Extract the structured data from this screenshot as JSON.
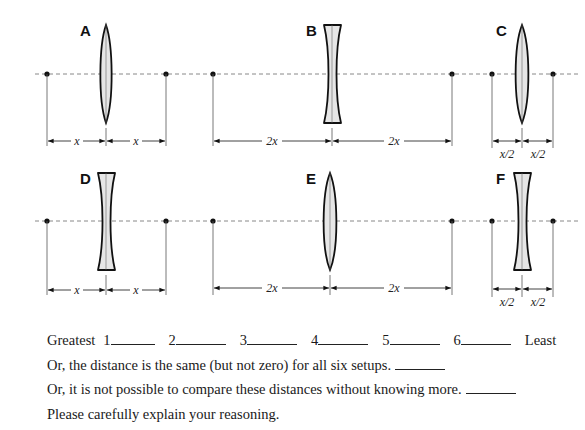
{
  "setups": [
    {
      "id": "A",
      "lens": "converging",
      "left_label": "x",
      "right_label": "x"
    },
    {
      "id": "B",
      "lens": "diverging",
      "left_label": "2x",
      "right_label": "2x"
    },
    {
      "id": "C",
      "lens": "converging",
      "left_label": "x/2",
      "right_label": "x/2"
    },
    {
      "id": "D",
      "lens": "diverging",
      "left_label": "x",
      "right_label": "x"
    },
    {
      "id": "E",
      "lens": "converging",
      "left_label": "2x",
      "right_label": "2x"
    },
    {
      "id": "F",
      "lens": "diverging",
      "left_label": "x/2",
      "right_label": "x/2"
    }
  ],
  "ranking": {
    "greatest_label": "Greatest",
    "least_label": "Least",
    "slots": [
      "1",
      "2",
      "3",
      "4",
      "5",
      "6"
    ]
  },
  "options": {
    "same": "Or, the distance is the same (but not zero) for all six setups.",
    "unknown": "Or, it is not possible to compare these distances without knowing more.",
    "explain": "Please carefully explain your reasoning."
  },
  "colors": {
    "lens_fill": "#e6e6e6",
    "stroke": "#111111",
    "axis": "#777777"
  }
}
